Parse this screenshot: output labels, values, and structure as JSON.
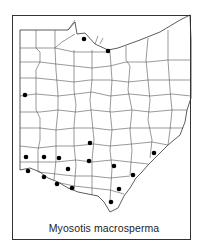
{
  "map": {
    "title": "Myosotis macrosperma",
    "region": "Ohio counties",
    "marker_color": "#000000",
    "line_color": "#555555",
    "records": [
      {
        "x": 84,
        "y": 39
      },
      {
        "x": 108,
        "y": 51
      },
      {
        "x": 25,
        "y": 95
      },
      {
        "x": 90,
        "y": 143
      },
      {
        "x": 26,
        "y": 157
      },
      {
        "x": 44,
        "y": 157
      },
      {
        "x": 59,
        "y": 158
      },
      {
        "x": 89,
        "y": 161
      },
      {
        "x": 28,
        "y": 171
      },
      {
        "x": 68,
        "y": 169
      },
      {
        "x": 44,
        "y": 177
      },
      {
        "x": 57,
        "y": 184
      },
      {
        "x": 72,
        "y": 188
      },
      {
        "x": 154,
        "y": 153
      },
      {
        "x": 114,
        "y": 166
      },
      {
        "x": 133,
        "y": 175
      },
      {
        "x": 119,
        "y": 189
      },
      {
        "x": 111,
        "y": 202
      }
    ]
  }
}
